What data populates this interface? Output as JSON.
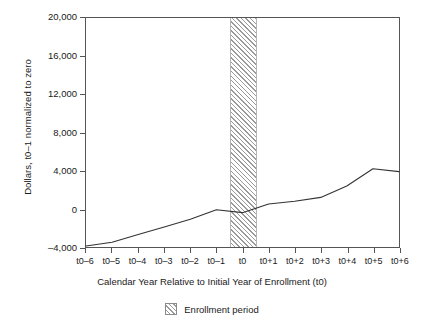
{
  "chart_data": {
    "type": "line",
    "title": "",
    "xlabel": "Calendar Year Relative to Initial Year of Enrollment (t0)",
    "ylabel": "Dollars, t0–1 normalized to zero",
    "categories": [
      "t0–6",
      "t0–5",
      "t0–4",
      "t0–3",
      "t0–2",
      "t0–1",
      "t0",
      "t0+1",
      "t0+2",
      "t0+3",
      "t0+4",
      "t0+5",
      "t0+6"
    ],
    "x": [
      -6,
      -5,
      -4,
      -3,
      -2,
      -1,
      0,
      1,
      2,
      3,
      4,
      5,
      6
    ],
    "values": [
      -3900,
      -3500,
      -2700,
      -1900,
      -1100,
      -100,
      -400,
      500,
      800,
      1200,
      2400,
      4200,
      3900
    ],
    "series": [
      {
        "name": "Dollars",
        "values": [
          -3900,
          -3500,
          -2700,
          -1900,
          -1100,
          -100,
          -400,
          500,
          800,
          1200,
          2400,
          4200,
          3900
        ]
      }
    ],
    "ylim": [
      -4000,
      20000
    ],
    "xlim": [
      -6,
      6
    ],
    "yticks": [
      -4000,
      0,
      4000,
      8000,
      12000,
      16000,
      20000
    ],
    "ytick_labels": [
      "–4,000",
      "0",
      "4,000",
      "8,000",
      "12,000",
      "16,000",
      "20,000"
    ],
    "grid": false,
    "legend_position": "bottom-center",
    "annotations": [
      {
        "type": "band",
        "label": "Enrollment period",
        "x_start": -0.5,
        "x_end": 0.5,
        "style": "hatched"
      }
    ]
  },
  "legend": {
    "items": [
      {
        "label": "Enrollment period",
        "swatch": "hatched-band-swatch"
      }
    ]
  }
}
